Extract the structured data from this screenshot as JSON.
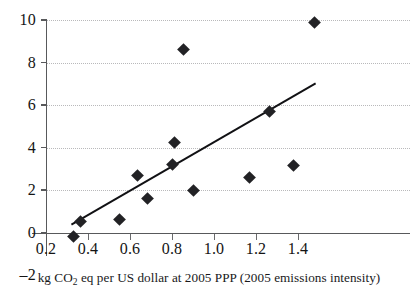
{
  "chart_data": {
    "type": "scatter",
    "title": "",
    "subtitle": "",
    "xlabel": "kg CO2 eq per US dollar at 2005 PPP (2005 emissions intensity)",
    "xlabel_parts": {
      "before_sub": "kg CO",
      "sub": "2",
      "after_sub": " eq per US dollar at 2005 PPP (2005 emissions intensity)"
    },
    "ylabel": "",
    "xlim": [
      0.2,
      1.53
    ],
    "ylim": [
      -2,
      10
    ],
    "xticks": [
      0.2,
      0.4,
      0.6,
      0.8,
      1.0,
      1.2,
      1.4
    ],
    "xticklabels": [
      "0.2",
      "0.4",
      "0.6",
      "0.8",
      "1.0",
      "1.2",
      "1.4"
    ],
    "yticks": [
      -2,
      0,
      2,
      4,
      6,
      8,
      10
    ],
    "yticklabels": [
      "–2",
      "0",
      "2",
      "4",
      "6",
      "8",
      "10"
    ],
    "grid": "horizontal-dotted",
    "gridlines_y": [
      2,
      4,
      6,
      8,
      10
    ],
    "legend": null,
    "marker_shape": "diamond",
    "marker_color": "#222225",
    "line_color": "#111114",
    "axis_color": "#58595b",
    "grid_color": "#b9b9bb",
    "points": [
      {
        "x": 0.33,
        "y": -0.2
      },
      {
        "x": 0.365,
        "y": 0.5
      },
      {
        "x": 0.55,
        "y": 0.6
      },
      {
        "x": 0.635,
        "y": 2.7
      },
      {
        "x": 0.685,
        "y": 1.6
      },
      {
        "x": 0.8,
        "y": 3.2
      },
      {
        "x": 0.81,
        "y": 4.25
      },
      {
        "x": 0.855,
        "y": 8.6
      },
      {
        "x": 0.9,
        "y": 2.0
      },
      {
        "x": 1.17,
        "y": 2.6
      },
      {
        "x": 1.265,
        "y": 5.7
      },
      {
        "x": 1.38,
        "y": 3.15
      },
      {
        "x": 1.48,
        "y": 9.9
      }
    ],
    "trendline": {
      "type": "linear",
      "x_start": 0.325,
      "y_start": 0.4,
      "x_end": 1.48,
      "y_end": 7.0
    }
  }
}
